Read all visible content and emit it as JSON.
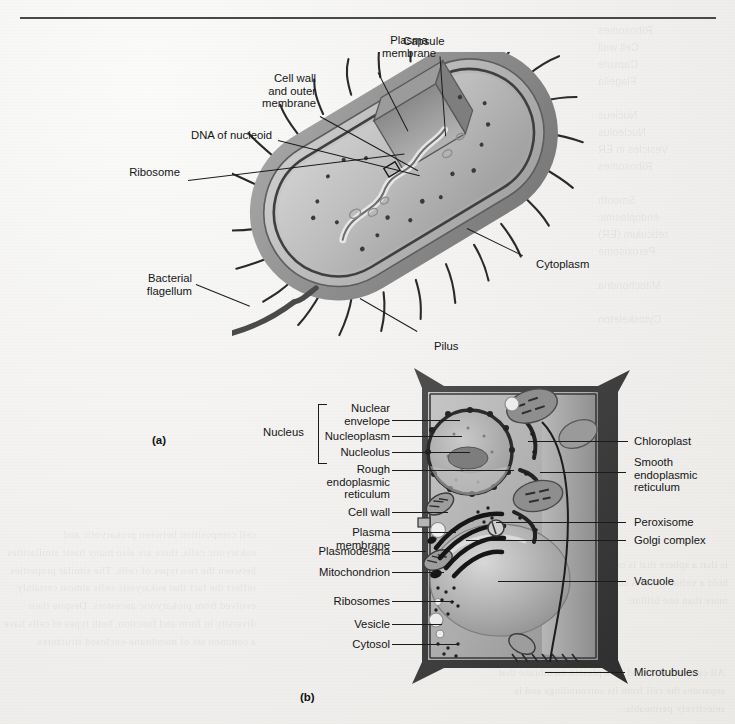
{
  "page": {
    "figure_a_caption": "(a)",
    "figure_b_caption": "(b)",
    "bleed_through_note": "faint mirrored text showing through from reverse side of page"
  },
  "figure_a": {
    "subject": "prokaryotic bacterial cell, cutaway view",
    "labels": [
      {
        "id": "plasma-membrane",
        "text": "Plasma\nmembrane"
      },
      {
        "id": "capsule",
        "text": "Capsule"
      },
      {
        "id": "cell-wall",
        "text": "Cell wall\nand outer\nmembrane"
      },
      {
        "id": "dna-nucleoid",
        "text": "DNA of nucleoid"
      },
      {
        "id": "ribosome",
        "text": "Ribosome"
      },
      {
        "id": "bacterial-flagellum",
        "text": "Bacterial\nflagellum"
      },
      {
        "id": "cytoplasm",
        "text": "Cytoplasm"
      },
      {
        "id": "pilus",
        "text": "Pilus"
      }
    ]
  },
  "figure_b": {
    "subject": "eukaryotic plant cell, cutaway view",
    "nucleus_group_label": "Nucleus",
    "labels_left": [
      {
        "id": "nuclear-envelope",
        "text": "Nuclear\nenvelope"
      },
      {
        "id": "nucleoplasm",
        "text": "Nucleoplasm"
      },
      {
        "id": "nucleolus",
        "text": "Nucleolus"
      },
      {
        "id": "rough-er",
        "text": "Rough\nendoplasmic\nreticulum"
      },
      {
        "id": "cell-wall",
        "text": "Cell wall"
      },
      {
        "id": "plasma-membrane",
        "text": "Plasma\nmembrane"
      },
      {
        "id": "plasmodesma",
        "text": "Plasmodesma"
      },
      {
        "id": "mitochondrion",
        "text": "Mitochondrion"
      },
      {
        "id": "ribosomes",
        "text": "Ribosomes"
      },
      {
        "id": "vesicle",
        "text": "Vesicle"
      },
      {
        "id": "cytosol",
        "text": "Cytosol"
      }
    ],
    "labels_right": [
      {
        "id": "chloroplast",
        "text": "Chloroplast"
      },
      {
        "id": "smooth-er",
        "text": "Smooth\nendoplasmic\nreticulum"
      },
      {
        "id": "peroxisome",
        "text": "Peroxisome"
      },
      {
        "id": "golgi-complex",
        "text": "Golgi complex"
      },
      {
        "id": "vacuole",
        "text": "Vacuole"
      },
      {
        "id": "microtubules",
        "text": "Microtubules"
      }
    ]
  },
  "bleed_text": {
    "right_column": "Ribosomes\nCell wall\nCapsule\nFlagella\n\nNucleus\nNucleolus\nVesicles in ER\nRibosomes\n\nSmooth\nendoplasmic\nreticulum (ER)\nPeroxisome\n\nMitochondria\n\nCytoskeleton",
    "left_block": "cell composition between prokaryotic and\neukaryotic cells, there are also many basic similarities\nbetween the two types of cells. The similar properties\nreflect the fact that eukaryotic cells almost certainly\nevolved from prokaryotic ancestors. Despite their\ndiversity in form and function, both types of cells have\na common set of membrane-enclosed structures.",
    "bottom_block": "All cells are bounded by a plasma membrane that\nseparates the cell from its surroundings and is\nselectively permeable.",
    "mid_block": "is that a sphere that is only 1 micron across could\nhold a volume that is smaller than a cell with\nmore than one billion."
  },
  "colors": {
    "paper": "#f1f0ee",
    "ink": "#151515",
    "rule": "#4a4a4a"
  }
}
